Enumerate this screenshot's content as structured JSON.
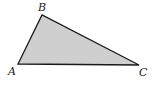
{
  "diagram": {
    "type": "triangle",
    "fill_color": "#cfcfcf",
    "stroke_color": "#1a1a1a",
    "vertices": [
      {
        "label": "A",
        "x": 18,
        "y": 64
      },
      {
        "label": "B",
        "x": 42,
        "y": 15
      },
      {
        "label": "C",
        "x": 139,
        "y": 65
      }
    ],
    "labels": {
      "A": "A",
      "B": "B",
      "C": "C"
    }
  }
}
